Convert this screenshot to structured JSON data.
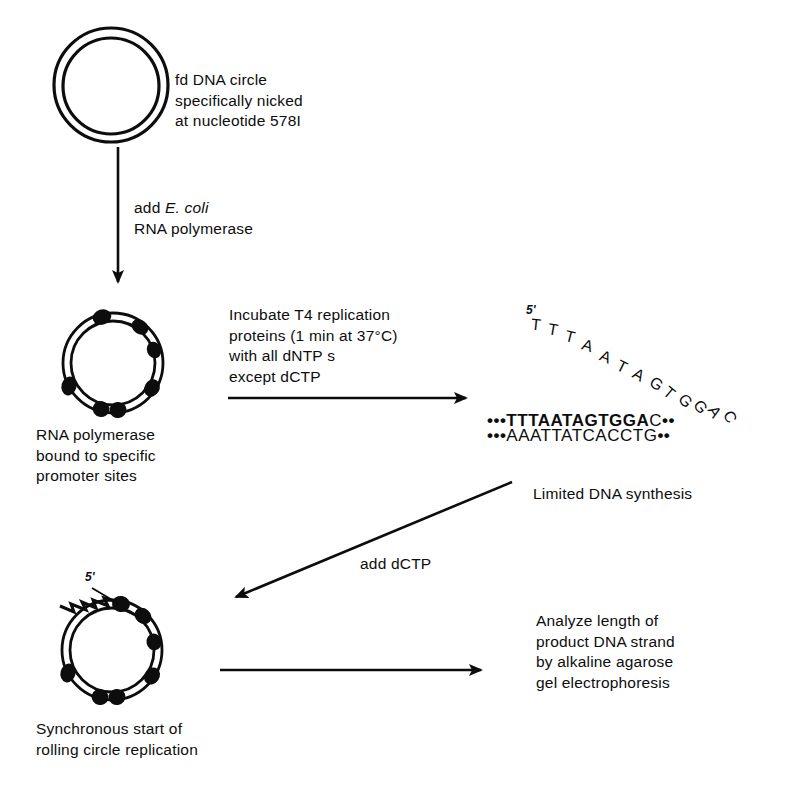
{
  "figure": {
    "ink_color": "#0d0d0d",
    "background": "#ffffff"
  },
  "steps": {
    "top_circle_caption": "fd DNA circle\nspecifically nicked\nat nucleotide 578I",
    "add_polymerase_label_pre": "add ",
    "add_polymerase_label_italic": "E. coli",
    "add_polymerase_label_post": "\nRNA polymerase",
    "bound_caption": "RNA polymerase\nbound to specific\npromoter sites",
    "incubate_label": "Incubate T4 replication\nproteins (1 min at 37°C)\nwith all dNTP s\nexcept dCTP",
    "limited_synthesis_caption": "Limited DNA synthesis",
    "add_dctp_label": "add dCTP",
    "synchronous_caption": "Synchronous start of\nrolling circle replication",
    "analyze_caption": "Analyze length of\nproduct DNA strand\nby alkaline agarose\ngel electrophoresis"
  },
  "sequence": {
    "five_prime_label": "5'",
    "arc_strand": "TTTAATAGTGGAC",
    "duplex_top_leading_dots": "•••",
    "duplex_top_bold": "TTTAATAGTGGA",
    "duplex_top_tail": "C",
    "duplex_top_trailing_dots": "••",
    "duplex_bottom_leading_dots": "•••",
    "duplex_bottom": "AAATTATCACCT",
    "duplex_bottom_tail": "G",
    "duplex_bottom_trailing_dots": "••"
  },
  "circles": {
    "top": {
      "label": "fd-dna-circle",
      "proteins": 0
    },
    "middle": {
      "label": "rna-polymerase-bound-circle",
      "proteins": 6
    },
    "bottom": {
      "label": "rolling-circle",
      "proteins": 6,
      "tail_label": "5'"
    }
  },
  "arrows": {
    "vertical_top": "add E. coli RNA polymerase",
    "horizontal_mid": "Incubate T4 replication proteins",
    "diagonal": "add dCTP",
    "horizontal_bottom": "Analyze length"
  }
}
